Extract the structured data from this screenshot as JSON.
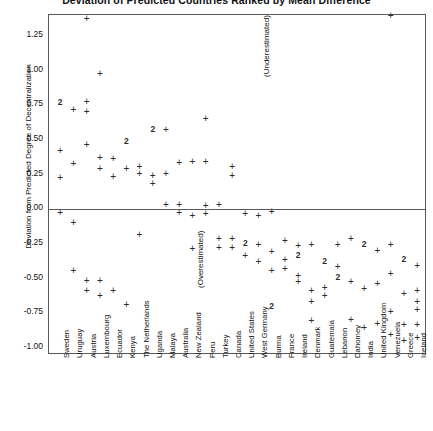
{
  "chart_data": {
    "type": "scatter",
    "title": "Deviation of Predicted Countries Ranked by Mean Difference",
    "xlabel": "",
    "ylabel": "Deviation from Predicted Degree of Decentralization",
    "ylim": [
      -1.05,
      1.4
    ],
    "yticks": [
      1.25,
      1.0,
      0.75,
      0.5,
      0.25,
      0.0,
      -0.25,
      -0.5,
      -0.75,
      -1.0
    ],
    "ytick_labels": [
      "1.25",
      "1.00",
      "0.75",
      "0.50",
      "0.25",
      "0.00",
      "-0.25",
      "-0.50",
      "-0.75",
      "-1.00"
    ],
    "grid": false,
    "legend": "none",
    "annotations": [
      {
        "text": "(Underestimated)",
        "orientation": "vertical",
        "x_country": "West Germany",
        "y": 0.95
      },
      {
        "text": "(Overestimated)",
        "orientation": "vertical",
        "x_country": "New Zealand",
        "y": -0.57
      }
    ],
    "categories": [
      "Sweden",
      "Uruguay",
      "Austria",
      "Luxembourg",
      "Ecuador",
      "Kenya",
      "The Netherlands",
      "Uganda",
      "Malaya",
      "Australia",
      "New Zealand",
      "Peru",
      "Turkey",
      "Canada",
      "United States",
      "West Germany",
      "Burma",
      "France",
      "Ireland",
      "Denmark",
      "Guatemala",
      "Lebanon",
      "Dahomey",
      "India",
      "United Kingdom",
      "Venezuela",
      "Greece",
      "Iceland"
    ],
    "marker_note": "'+' marks a single observation; a bold '2' marks two coincident observations",
    "points": [
      {
        "country": "Sweden",
        "y": 0.77,
        "marker": "2"
      },
      {
        "country": "Sweden",
        "y": 0.43,
        "marker": "+"
      },
      {
        "country": "Sweden",
        "y": 0.23,
        "marker": "+"
      },
      {
        "country": "Sweden",
        "y": -0.02,
        "marker": "+"
      },
      {
        "country": "Uruguay",
        "y": 0.72,
        "marker": "+"
      },
      {
        "country": "Uruguay",
        "y": 0.33,
        "marker": "+"
      },
      {
        "country": "Uruguay",
        "y": -0.09,
        "marker": "+"
      },
      {
        "country": "Uruguay",
        "y": -0.44,
        "marker": "+"
      },
      {
        "country": "Austria",
        "y": 1.38,
        "marker": "+"
      },
      {
        "country": "Austria",
        "y": 0.78,
        "marker": "+"
      },
      {
        "country": "Austria",
        "y": 0.71,
        "marker": "+"
      },
      {
        "country": "Austria",
        "y": 0.47,
        "marker": "+"
      },
      {
        "country": "Austria",
        "y": -0.51,
        "marker": "+"
      },
      {
        "country": "Austria",
        "y": -0.58,
        "marker": "+"
      },
      {
        "country": "Luxembourg",
        "y": 0.98,
        "marker": "+"
      },
      {
        "country": "Luxembourg",
        "y": 0.38,
        "marker": "+"
      },
      {
        "country": "Luxembourg",
        "y": 0.3,
        "marker": "+"
      },
      {
        "country": "Luxembourg",
        "y": -0.51,
        "marker": "+"
      },
      {
        "country": "Luxembourg",
        "y": -0.62,
        "marker": "+"
      },
      {
        "country": "Ecuador",
        "y": 0.37,
        "marker": "+"
      },
      {
        "country": "Ecuador",
        "y": 0.24,
        "marker": "+"
      },
      {
        "country": "Ecuador",
        "y": -0.58,
        "marker": "+"
      },
      {
        "country": "Kenya",
        "y": 0.49,
        "marker": "2"
      },
      {
        "country": "Kenya",
        "y": 0.3,
        "marker": "+"
      },
      {
        "country": "Kenya",
        "y": -0.68,
        "marker": "+"
      },
      {
        "country": "The Netherlands",
        "y": 0.31,
        "marker": "+"
      },
      {
        "country": "The Netherlands",
        "y": 0.26,
        "marker": "+"
      },
      {
        "country": "The Netherlands",
        "y": -0.18,
        "marker": "+"
      },
      {
        "country": "Uganda",
        "y": 0.58,
        "marker": "2"
      },
      {
        "country": "Uganda",
        "y": 0.25,
        "marker": "+"
      },
      {
        "country": "Uganda",
        "y": 0.19,
        "marker": "+"
      },
      {
        "country": "Malaya",
        "y": 0.58,
        "marker": "+"
      },
      {
        "country": "Malaya",
        "y": 0.26,
        "marker": "+"
      },
      {
        "country": "Malaya",
        "y": 0.04,
        "marker": "+"
      },
      {
        "country": "Australia",
        "y": 0.34,
        "marker": "+"
      },
      {
        "country": "Australia",
        "y": 0.04,
        "marker": "+"
      },
      {
        "country": "Australia",
        "y": -0.02,
        "marker": "+"
      },
      {
        "country": "New Zealand",
        "y": 0.35,
        "marker": "+"
      },
      {
        "country": "New Zealand",
        "y": -0.04,
        "marker": "+"
      },
      {
        "country": "New Zealand",
        "y": -0.28,
        "marker": "+"
      },
      {
        "country": "Peru",
        "y": 0.66,
        "marker": "+"
      },
      {
        "country": "Peru",
        "y": 0.35,
        "marker": "+"
      },
      {
        "country": "Peru",
        "y": 0.03,
        "marker": "+"
      },
      {
        "country": "Peru",
        "y": -0.03,
        "marker": "+"
      },
      {
        "country": "Turkey",
        "y": 0.04,
        "marker": "+"
      },
      {
        "country": "Turkey",
        "y": -0.21,
        "marker": "+"
      },
      {
        "country": "Turkey",
        "y": -0.27,
        "marker": "+"
      },
      {
        "country": "Canada",
        "y": 0.31,
        "marker": "+"
      },
      {
        "country": "Canada",
        "y": 0.25,
        "marker": "+"
      },
      {
        "country": "Canada",
        "y": -0.21,
        "marker": "+"
      },
      {
        "country": "Canada",
        "y": -0.27,
        "marker": "+"
      },
      {
        "country": "United States",
        "y": -0.03,
        "marker": "+"
      },
      {
        "country": "United States",
        "y": -0.24,
        "marker": "2"
      },
      {
        "country": "United States",
        "y": -0.33,
        "marker": "+"
      },
      {
        "country": "West Germany",
        "y": -0.04,
        "marker": "+"
      },
      {
        "country": "West Germany",
        "y": -0.25,
        "marker": "+"
      },
      {
        "country": "West Germany",
        "y": -0.37,
        "marker": "+"
      },
      {
        "country": "Burma",
        "y": -0.01,
        "marker": "+"
      },
      {
        "country": "Burma",
        "y": -0.3,
        "marker": "+"
      },
      {
        "country": "Burma",
        "y": -0.44,
        "marker": "+"
      },
      {
        "country": "Burma",
        "y": -0.7,
        "marker": "2"
      },
      {
        "country": "France",
        "y": -0.22,
        "marker": "+"
      },
      {
        "country": "France",
        "y": -0.36,
        "marker": "+"
      },
      {
        "country": "France",
        "y": -0.42,
        "marker": "+"
      },
      {
        "country": "Ireland",
        "y": -0.26,
        "marker": "+"
      },
      {
        "country": "Ireland",
        "y": -0.33,
        "marker": "2"
      },
      {
        "country": "Ireland",
        "y": -0.47,
        "marker": "+"
      },
      {
        "country": "Ireland",
        "y": -0.52,
        "marker": "+"
      },
      {
        "country": "Denmark",
        "y": -0.25,
        "marker": "+"
      },
      {
        "country": "Denmark",
        "y": -0.58,
        "marker": "+"
      },
      {
        "country": "Denmark",
        "y": -0.66,
        "marker": "+"
      },
      {
        "country": "Denmark",
        "y": -0.8,
        "marker": "+"
      },
      {
        "country": "Guatemala",
        "y": -0.37,
        "marker": "2"
      },
      {
        "country": "Guatemala",
        "y": -0.56,
        "marker": "+"
      },
      {
        "country": "Guatemala",
        "y": -0.62,
        "marker": "+"
      },
      {
        "country": "Lebanon",
        "y": -0.25,
        "marker": "+"
      },
      {
        "country": "Lebanon",
        "y": -0.41,
        "marker": "+"
      },
      {
        "country": "Lebanon",
        "y": -0.49,
        "marker": "2"
      },
      {
        "country": "Dahomey",
        "y": -0.21,
        "marker": "+"
      },
      {
        "country": "Dahomey",
        "y": -0.52,
        "marker": "+"
      },
      {
        "country": "Dahomey",
        "y": -0.79,
        "marker": "+"
      },
      {
        "country": "India",
        "y": -0.25,
        "marker": "2"
      },
      {
        "country": "India",
        "y": -0.57,
        "marker": "+"
      },
      {
        "country": "India",
        "y": -0.85,
        "marker": "+"
      },
      {
        "country": "United Kingdom",
        "y": -0.29,
        "marker": "+"
      },
      {
        "country": "United Kingdom",
        "y": -0.53,
        "marker": "+"
      },
      {
        "country": "United Kingdom",
        "y": -0.82,
        "marker": "+"
      },
      {
        "country": "Venezuela",
        "y": 1.4,
        "marker": "+"
      },
      {
        "country": "Venezuela",
        "y": -0.25,
        "marker": "+"
      },
      {
        "country": "Venezuela",
        "y": -0.46,
        "marker": "+"
      },
      {
        "country": "Venezuela",
        "y": -0.73,
        "marker": "+"
      },
      {
        "country": "Venezuela",
        "y": -0.9,
        "marker": "+"
      },
      {
        "country": "Greece",
        "y": -0.36,
        "marker": "2"
      },
      {
        "country": "Greece",
        "y": -0.6,
        "marker": "+"
      },
      {
        "country": "Greece",
        "y": -0.83,
        "marker": "+"
      },
      {
        "country": "Greece",
        "y": -0.94,
        "marker": "+"
      },
      {
        "country": "Iceland",
        "y": -0.4,
        "marker": "+"
      },
      {
        "country": "Iceland",
        "y": -0.58,
        "marker": "+"
      },
      {
        "country": "Iceland",
        "y": -0.66,
        "marker": "+"
      },
      {
        "country": "Iceland",
        "y": -0.72,
        "marker": "+"
      },
      {
        "country": "Iceland",
        "y": -0.83,
        "marker": "+"
      },
      {
        "country": "Iceland",
        "y": -0.92,
        "marker": "+"
      }
    ]
  },
  "markers": {
    "single": "+",
    "double": "2"
  }
}
